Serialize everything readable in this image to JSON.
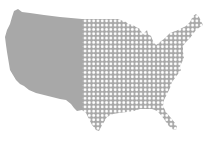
{
  "map": {
    "subject": "contiguous-united-states",
    "style": "halftone-split",
    "colors": {
      "land": "#a8a8a8",
      "dots": "#ffffff",
      "background": "#ffffff"
    },
    "regions": [
      {
        "name": "west",
        "fill": "solid"
      },
      {
        "name": "east",
        "fill": "dotted-grid"
      }
    ],
    "split_x": 82,
    "grid_spacing": 4.3
  }
}
